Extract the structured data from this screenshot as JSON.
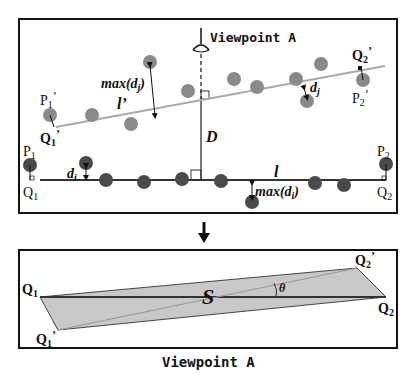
{
  "diagram": {
    "top_panel": {
      "viewpoint_label": "Viewpoint A",
      "labels": {
        "P1": "P",
        "P1_sub": "1",
        "Q1": "Q",
        "Q1_sub": "1",
        "P2": "P",
        "P2_sub": "2",
        "Q2": "Q",
        "Q2_sub": "2",
        "P1p": "P",
        "P1p_sub": "1",
        "P1p_prime": "’",
        "Q1p": "Q",
        "Q1p_sub": "1",
        "Q1p_prime": "’",
        "P2p": "P",
        "P2p_sub": "2",
        "P2p_prime": "’",
        "Q2p": "Q",
        "Q2p_sub": "2",
        "Q2p_prime": "’",
        "l": "l",
        "lp": "l’",
        "D": "D",
        "di": "d",
        "di_sub": "i",
        "dj": "d",
        "dj_sub": "j",
        "max_di": "max(d",
        "max_di_sub": "i",
        "max_di_close": ")",
        "max_dj": "max(d",
        "max_dj_sub": "j",
        "max_dj_close": ")"
      }
    },
    "arrow": "down-arrow",
    "bottom_panel": {
      "labels": {
        "Q1": "Q",
        "Q1_sub": "1",
        "Q2": "Q",
        "Q2_sub": "2",
        "Q1p": "Q",
        "Q1p_sub": "1",
        "Q1p_prime": "’",
        "Q2p": "Q",
        "Q2p_sub": "2",
        "Q2p_prime": "’",
        "S": "S",
        "theta": "θ"
      }
    },
    "caption": "Viewpoint A",
    "colors": {
      "dark_point": "#4a4a4a",
      "light_point": "#888888",
      "line_l": "#333333",
      "line_lp": "#aaaaaa",
      "region_fill": "#c8c8c8",
      "border": "#111111"
    }
  }
}
